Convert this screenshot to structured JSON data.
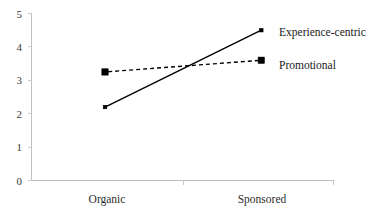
{
  "chart_data": {
    "type": "line",
    "title": "",
    "xlabel": "",
    "ylabel": "",
    "categories": [
      "Organic",
      "Sponsored"
    ],
    "series": [
      {
        "name": "Experience-centric",
        "values": [
          2.2,
          4.5
        ],
        "line_style": "solid",
        "marker": "dot",
        "color": "#000000"
      },
      {
        "name": "Promotional",
        "values": [
          3.25,
          3.6
        ],
        "line_style": "dashed",
        "marker": "square",
        "color": "#000000"
      }
    ],
    "ylim": [
      0,
      5
    ],
    "yticks": [
      "0",
      "1",
      "2",
      "3",
      "4",
      "5"
    ],
    "ytick_values": [
      0,
      1,
      2,
      3,
      4,
      5
    ],
    "xticks": [
      "Organic",
      "Sponsored"
    ],
    "grid": false,
    "legend_position": "right-inline",
    "axis_color": "#bfbfbf",
    "text_color": "#2e2e2e"
  },
  "labels": {
    "y_0": "0",
    "y_1": "1",
    "y_2": "2",
    "y_3": "3",
    "y_4": "4",
    "y_5": "5",
    "x_organic": "Organic",
    "x_sponsored": "Sponsored",
    "series_experience": "Experience-centric",
    "series_promotional": "Promotional"
  }
}
